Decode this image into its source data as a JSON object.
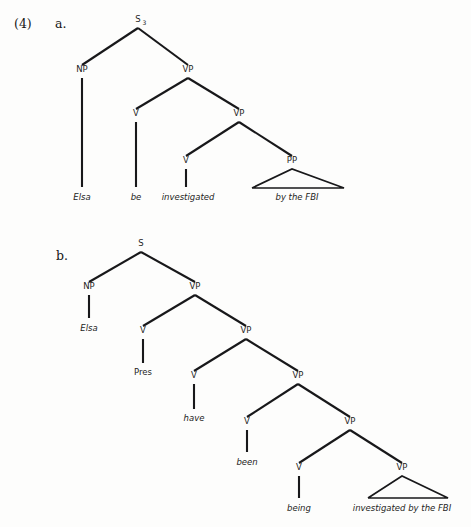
{
  "page": {
    "example_number": "(4)",
    "background_color": "#fdfdfc",
    "ink_color": "#18181a"
  },
  "trees": [
    {
      "id": "tree-a",
      "label": "a.",
      "label_pos": {
        "x": 55,
        "y": 24
      },
      "sentence": "Elsa be investigated by the FBI",
      "nodes": [
        {
          "id": "a-s",
          "label": "S",
          "subscript": "3",
          "x": 138,
          "y": 22
        },
        {
          "id": "a-np",
          "label": "NP",
          "x": 82,
          "y": 72
        },
        {
          "id": "a-vp1",
          "label": "VP",
          "x": 188,
          "y": 72
        },
        {
          "id": "a-v1",
          "label": "V",
          "x": 136,
          "y": 116
        },
        {
          "id": "a-vp2",
          "label": "VP",
          "x": 239,
          "y": 116
        },
        {
          "id": "a-v2",
          "label": "V",
          "x": 186,
          "y": 163
        },
        {
          "id": "a-pp",
          "label": "PP",
          "x": 292,
          "y": 163
        }
      ],
      "branches": [
        {
          "from": {
            "x": 138,
            "y": 28
          },
          "to": {
            "x": 82,
            "y": 65
          }
        },
        {
          "from": {
            "x": 138,
            "y": 28
          },
          "to": {
            "x": 188,
            "y": 65
          }
        },
        {
          "from": {
            "x": 188,
            "y": 78
          },
          "to": {
            "x": 136,
            "y": 109
          }
        },
        {
          "from": {
            "x": 188,
            "y": 78
          },
          "to": {
            "x": 239,
            "y": 109
          }
        },
        {
          "from": {
            "x": 239,
            "y": 122
          },
          "to": {
            "x": 186,
            "y": 156
          }
        },
        {
          "from": {
            "x": 239,
            "y": 122
          },
          "to": {
            "x": 292,
            "y": 156
          }
        }
      ],
      "stems": [
        {
          "x": 82,
          "y1": 78,
          "y2": 187
        },
        {
          "x": 136,
          "y1": 122,
          "y2": 187
        },
        {
          "x": 186,
          "y1": 169,
          "y2": 187
        }
      ],
      "triangles": [
        {
          "apex_x": 292,
          "apex_y": 169,
          "base_y": 188,
          "base_left": 252,
          "base_right": 344
        }
      ],
      "terminals": [
        {
          "text": "Elsa",
          "x": 82,
          "y": 200,
          "style": "italic"
        },
        {
          "text": "be",
          "x": 136,
          "y": 200,
          "style": "italic"
        },
        {
          "text": "investigated",
          "x": 188,
          "y": 200,
          "style": "italic"
        },
        {
          "text": "by the FBI",
          "x": 297,
          "y": 200,
          "style": "italic"
        }
      ]
    },
    {
      "id": "tree-b",
      "label": "b.",
      "label_pos": {
        "x": 56,
        "y": 256
      },
      "sentence": "Elsa Pres have been being investigated by the FBI",
      "nodes": [
        {
          "id": "b-s",
          "label": "S",
          "x": 141,
          "y": 246
        },
        {
          "id": "b-np",
          "label": "NP",
          "x": 89,
          "y": 289
        },
        {
          "id": "b-vp1",
          "label": "VP",
          "x": 195,
          "y": 289
        },
        {
          "id": "b-v1",
          "label": "V",
          "x": 143,
          "y": 333
        },
        {
          "id": "b-vp2",
          "label": "VP",
          "x": 246,
          "y": 333
        },
        {
          "id": "b-v2",
          "label": "V",
          "x": 194,
          "y": 378
        },
        {
          "id": "b-vp3",
          "label": "VP",
          "x": 298,
          "y": 378
        },
        {
          "id": "b-v3",
          "label": "V",
          "x": 247,
          "y": 424
        },
        {
          "id": "b-vp4",
          "label": "VP",
          "x": 350,
          "y": 424
        },
        {
          "id": "b-v4",
          "label": "V",
          "x": 299,
          "y": 470
        },
        {
          "id": "b-vp5",
          "label": "VP",
          "x": 402,
          "y": 470
        }
      ],
      "branches": [
        {
          "from": {
            "x": 141,
            "y": 252
          },
          "to": {
            "x": 89,
            "y": 282
          }
        },
        {
          "from": {
            "x": 141,
            "y": 252
          },
          "to": {
            "x": 195,
            "y": 282
          }
        },
        {
          "from": {
            "x": 195,
            "y": 295
          },
          "to": {
            "x": 143,
            "y": 326
          }
        },
        {
          "from": {
            "x": 195,
            "y": 295
          },
          "to": {
            "x": 246,
            "y": 326
          }
        },
        {
          "from": {
            "x": 246,
            "y": 339
          },
          "to": {
            "x": 194,
            "y": 371
          }
        },
        {
          "from": {
            "x": 246,
            "y": 339
          },
          "to": {
            "x": 298,
            "y": 371
          }
        },
        {
          "from": {
            "x": 298,
            "y": 384
          },
          "to": {
            "x": 247,
            "y": 417
          }
        },
        {
          "from": {
            "x": 298,
            "y": 384
          },
          "to": {
            "x": 350,
            "y": 417
          }
        },
        {
          "from": {
            "x": 350,
            "y": 430
          },
          "to": {
            "x": 299,
            "y": 463
          }
        },
        {
          "from": {
            "x": 350,
            "y": 430
          },
          "to": {
            "x": 402,
            "y": 463
          }
        }
      ],
      "stems": [
        {
          "x": 89,
          "y1": 295,
          "y2": 318
        },
        {
          "x": 143,
          "y1": 339,
          "y2": 363
        },
        {
          "x": 194,
          "y1": 384,
          "y2": 409
        },
        {
          "x": 247,
          "y1": 430,
          "y2": 452
        },
        {
          "x": 299,
          "y1": 476,
          "y2": 498
        }
      ],
      "triangles": [
        {
          "apex_x": 402,
          "apex_y": 476,
          "base_y": 498,
          "base_left": 368,
          "base_right": 448
        }
      ],
      "terminals": [
        {
          "text": "Elsa",
          "x": 89,
          "y": 331,
          "style": "italic"
        },
        {
          "text": "Pres",
          "x": 143,
          "y": 375,
          "style": "roman"
        },
        {
          "text": "have",
          "x": 194,
          "y": 421,
          "style": "italic"
        },
        {
          "text": "been",
          "x": 247,
          "y": 465,
          "style": "italic"
        },
        {
          "text": "being",
          "x": 299,
          "y": 511,
          "style": "italic"
        },
        {
          "text": "investigated by the FBI",
          "x": 402,
          "y": 511,
          "style": "italic"
        }
      ]
    }
  ]
}
